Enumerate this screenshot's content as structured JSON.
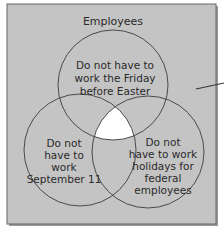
{
  "diagram": {
    "type": "venn",
    "universe_label": "Employees",
    "sets": [
      {
        "id": "friday",
        "label_lines": [
          "Do not have to",
          "work the Friday",
          "before Easter"
        ]
      },
      {
        "id": "sept11",
        "label_lines": [
          "Do not",
          "have to",
          "work",
          "September 11"
        ]
      },
      {
        "id": "federal",
        "label_lines": [
          "Do not",
          "have to work",
          "holidays for",
          "federal",
          "employees"
        ]
      }
    ],
    "highlighted_region": "intersection of all three sets",
    "colors": {
      "background": "#c4c4c4",
      "border": "#555555",
      "circle_stroke": "#4a4a4a",
      "highlight": "#ffffff",
      "text": "#2a2a2a"
    }
  }
}
